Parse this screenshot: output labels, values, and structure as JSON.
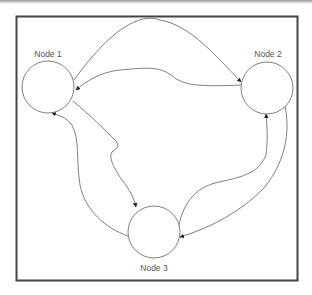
{
  "diagram": {
    "type": "directed-graph",
    "frame": {
      "x": 16,
      "y": 16,
      "width": 281,
      "height": 264,
      "stroke": "#444444"
    },
    "edge_color": "#707070",
    "node_stroke": "#707070",
    "nodes": [
      {
        "id": "n1",
        "label": "Node 1",
        "cx": 48,
        "cy": 87,
        "r": 26
      },
      {
        "id": "n2",
        "label": "Node 2",
        "cx": 267,
        "cy": 88,
        "r": 26
      },
      {
        "id": "n3",
        "label": "Node 3",
        "cx": 154,
        "cy": 232,
        "r": 26
      }
    ],
    "edges": [
      {
        "from": "Node 2",
        "to": "Node 1",
        "route": "upper arc over top"
      },
      {
        "from": "Node 2",
        "to": "Node 1",
        "route": "middle wave"
      },
      {
        "from": "Node 1",
        "to": "Node 2",
        "route": "upper arc, arrow at Node 2"
      },
      {
        "from": "Node 1",
        "to": "Node 3",
        "route": "zigzag down"
      },
      {
        "from": "Node 3",
        "to": "Node 1",
        "route": "left curve up"
      },
      {
        "from": "Node 3",
        "to": "Node 2",
        "route": "right S-curve"
      },
      {
        "from": "Node 2",
        "to": "Node 3",
        "route": "outer right curve"
      }
    ]
  }
}
